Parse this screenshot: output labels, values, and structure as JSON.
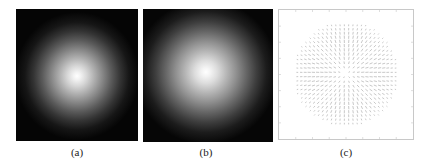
{
  "figure": {
    "panels": [
      {
        "id": "a",
        "label": "(a)",
        "type": "grayscale-image",
        "description": "Radially symmetric bright blob on black background"
      },
      {
        "id": "b",
        "label": "(b)",
        "type": "grayscale-image",
        "description": "Slightly wider radially symmetric bright blob on black background"
      },
      {
        "id": "c",
        "label": "(c)",
        "type": "quiver-plot",
        "description": "Vector field with arrows radiating from center within a circular region",
        "colors": {
          "arrows": "#9a9a9a",
          "frame": "#c8c8c8",
          "background": "#ffffff"
        }
      }
    ]
  }
}
